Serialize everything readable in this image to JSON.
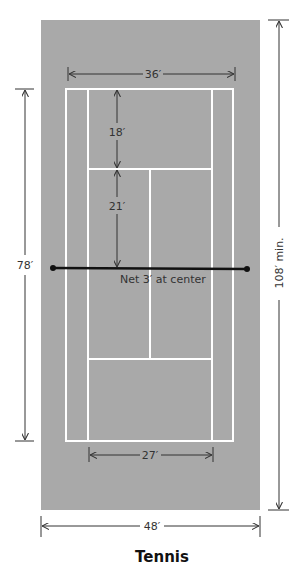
{
  "title": "Tennis",
  "colors": {
    "surface": "#a9a9a9",
    "lines": "#ffffff",
    "dimension": "#333333",
    "net": "#111111",
    "background": "#ffffff"
  },
  "dimensions": {
    "doubles_width": "36′",
    "singles_width": "27′",
    "court_length": "78′",
    "area_width": "48′",
    "area_length": "108′ min.",
    "baseline_to_service": "18′",
    "service_to_net": "21′"
  },
  "net": {
    "label": "Net 3′ at center"
  }
}
